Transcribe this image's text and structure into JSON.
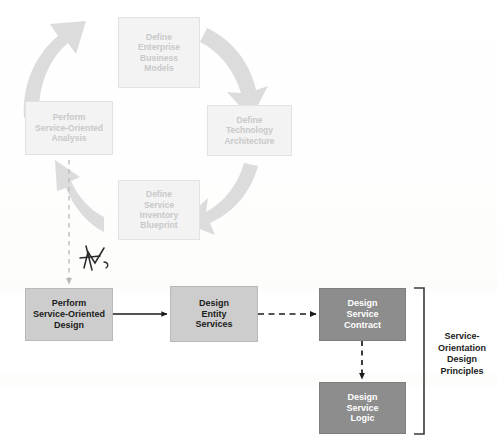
{
  "diagram": {
    "colors": {
      "cycle_box_fill": "#f3f3f3",
      "cycle_box_text": "#c9c9c9",
      "light_box_fill": "#cdcdcd",
      "light_box_text": "#1b1b1b",
      "dark_box_fill": "#8d8d8d",
      "dark_box_text": "#ffffff",
      "cycle_arrow": "#dcdcdc",
      "solid_arrow": "#1b1b1b",
      "dashed_arrow": "#1b1b1b",
      "faint_dashed": "#b9b9b9",
      "bracket": "#3a3a3a",
      "pen_ink": "#2a2a2a"
    },
    "cycle": {
      "name": "soa-delivery-lifecycle",
      "direction": "clockwise",
      "steps": [
        {
          "id": "define-enterprise-business-models",
          "lines": [
            "Define",
            "Enterprise",
            "Business",
            "Models"
          ],
          "position": "top"
        },
        {
          "id": "define-technology-architecture",
          "lines": [
            "Define",
            "Technology",
            "Architecture"
          ],
          "position": "right"
        },
        {
          "id": "define-service-inventory-blueprint",
          "lines": [
            "Define",
            "Service",
            "Inventory",
            "Blueprint"
          ],
          "position": "bottom"
        },
        {
          "id": "perform-service-oriented-analysis",
          "lines": [
            "Perform",
            "Service-Oriented",
            "Analysis"
          ],
          "position": "left"
        }
      ]
    },
    "flow": {
      "name": "service-oriented-design-flow",
      "steps": [
        {
          "id": "perform-service-oriented-design",
          "lines": [
            "Perform",
            "Service-Oriented",
            "Design"
          ],
          "style": "light"
        },
        {
          "id": "design-entity-services",
          "lines": [
            "Design",
            "Entity",
            "Services"
          ],
          "style": "light"
        },
        {
          "id": "design-service-contract",
          "lines": [
            "Design",
            "Service",
            "Contract"
          ],
          "style": "dark"
        },
        {
          "id": "design-service-logic",
          "lines": [
            "Design",
            "Service",
            "Logic"
          ],
          "style": "dark"
        }
      ],
      "connectors": [
        {
          "from": "perform-service-oriented-analysis",
          "to": "perform-service-oriented-design",
          "style": "dashed-faint",
          "direction": "down"
        },
        {
          "from": "perform-service-oriented-design",
          "to": "design-entity-services",
          "style": "solid",
          "direction": "right"
        },
        {
          "from": "design-entity-services",
          "to": "design-service-contract",
          "style": "dashed",
          "direction": "right"
        },
        {
          "from": "design-service-contract",
          "to": "design-service-logic",
          "style": "dashed",
          "direction": "down"
        }
      ]
    },
    "bracket": {
      "id": "service-orientation-design-principles",
      "lines": [
        "Service-",
        "Orientation",
        "Design",
        "Principles"
      ],
      "covers": [
        "design-service-contract",
        "design-service-logic"
      ]
    },
    "annotation": {
      "id": "handwritten-pen-mark",
      "description": "handwritten ink scribble"
    }
  }
}
